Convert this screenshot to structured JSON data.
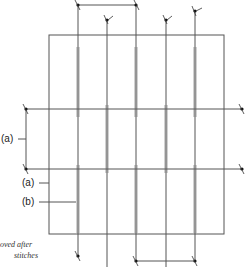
{
  "diagram": {
    "labels": {
      "a_outer": "(a)",
      "a_inner": "(a)",
      "b": "(b)"
    },
    "note_lines": [
      "oved after",
      "stitches"
    ],
    "vertical_threads": 5,
    "horizontal_threads": 2,
    "colors": {
      "line": "#555555",
      "dot": "#111111"
    }
  }
}
